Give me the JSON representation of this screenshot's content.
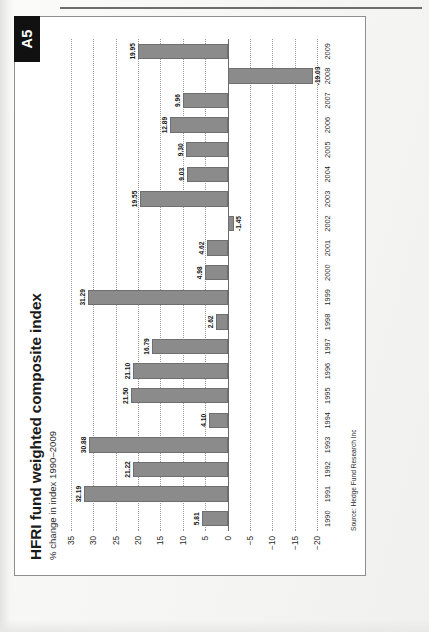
{
  "page": {
    "badge": "A5"
  },
  "figure": {
    "title": "HFRI fund weighted composite index",
    "subtitle": "% change in index 1990–2009",
    "source": "Source: Hedge Fund Research Inc"
  },
  "chart_data": {
    "type": "bar",
    "title": "HFRI fund weighted composite index",
    "subtitle": "% change in index 1990–2009",
    "xlabel": "",
    "ylabel": "",
    "ylim": [
      -20,
      35
    ],
    "yticks": [
      35,
      30,
      25,
      20,
      15,
      10,
      5,
      0,
      -5,
      -10,
      -15,
      -20
    ],
    "ytick_labels": [
      "35",
      "30",
      "25",
      "20",
      "15",
      "10",
      "5",
      "0",
      "−5",
      "−10",
      "−15",
      "−20"
    ],
    "grid": true,
    "legend": null,
    "categories": [
      "1990",
      "1991",
      "1992",
      "1993",
      "1994",
      "1995",
      "1996",
      "1997",
      "1998",
      "1999",
      "2000",
      "2001",
      "2002",
      "2003",
      "2004",
      "2005",
      "2006",
      "2007",
      "2008",
      "2009"
    ],
    "values": [
      5.81,
      32.19,
      21.22,
      30.88,
      4.1,
      21.5,
      21.1,
      16.79,
      2.62,
      31.29,
      4.98,
      4.62,
      -1.45,
      19.55,
      9.03,
      9.3,
      12.89,
      9.96,
      -19.03,
      19.95
    ],
    "value_labels": [
      "5.81",
      "32.19",
      "21.22",
      "30.88",
      "4.10",
      "21.50",
      "21.10",
      "16.79",
      "2.62",
      "31.29",
      "4.98",
      "4.62",
      "-1.45",
      "19.55",
      "9.03",
      "9.30",
      "12.89",
      "9.96",
      "-19.03",
      "19.95"
    ],
    "bar_color": "#8b8b8b",
    "bar_edge_color": "#6f6f6f",
    "source": "Source: Hedge Fund Research Inc"
  }
}
